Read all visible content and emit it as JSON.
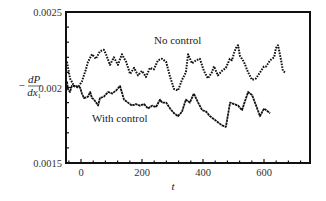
{
  "chart_data": {
    "type": "line",
    "title": "",
    "xlabel": "t",
    "ylabel": "-dP/dx1",
    "xlim": [
      -45,
      755
    ],
    "ylim": [
      0.0015,
      0.0025
    ],
    "x_ticks": [
      0,
      200,
      400,
      600
    ],
    "x_tick_labels": [
      "0",
      "200",
      "400",
      "600"
    ],
    "y_ticks": [
      0.0015,
      0.002,
      0.0025
    ],
    "y_tick_labels": [
      "0.0015",
      "0.002",
      "0.0025"
    ],
    "grid": false,
    "legend": "inline annotations",
    "annotations": [
      {
        "text": "No control",
        "x": 260,
        "y": 0.00233
      },
      {
        "text": "With control",
        "x": 155,
        "y": 0.00192
      }
    ],
    "series": [
      {
        "name": "No control",
        "style": "dashed",
        "x": [
          -49,
          -36,
          -23,
          -10,
          3,
          16,
          23,
          36,
          49,
          62,
          75,
          82,
          95,
          108,
          121,
          134,
          148,
          161,
          174,
          187,
          200,
          213,
          226,
          239,
          252,
          266,
          279,
          292,
          305,
          318,
          331,
          344,
          351,
          364,
          377,
          390,
          403,
          416,
          429,
          436,
          449,
          462,
          475,
          488,
          495,
          502,
          508,
          515,
          521,
          534,
          548,
          561,
          574,
          587,
          600,
          607,
          620,
          633,
          639,
          646,
          656,
          662,
          669
        ],
        "y": [
          0.00217,
          0.00206,
          0.00201,
          0.002,
          0.00204,
          0.00212,
          0.00217,
          0.00222,
          0.00219,
          0.00224,
          0.00225,
          0.00222,
          0.00215,
          0.0022,
          0.00215,
          0.00222,
          0.00217,
          0.00209,
          0.00213,
          0.00208,
          0.00211,
          0.00207,
          0.00213,
          0.00212,
          0.00218,
          0.00219,
          0.00217,
          0.00207,
          0.00199,
          0.00198,
          0.00205,
          0.0021,
          0.00222,
          0.00216,
          0.00218,
          0.00219,
          0.00211,
          0.00206,
          0.0021,
          0.00214,
          0.00208,
          0.00211,
          0.00213,
          0.00219,
          0.00218,
          0.00223,
          0.00226,
          0.00228,
          0.00221,
          0.00217,
          0.0021,
          0.00205,
          0.00206,
          0.0021,
          0.00214,
          0.00214,
          0.00218,
          0.0022,
          0.00226,
          0.00228,
          0.00218,
          0.00211,
          0.0021
        ]
      },
      {
        "name": "With control",
        "style": "dotted-solid",
        "x": [
          -49,
          -43,
          -36,
          -30,
          -16,
          -3,
          3,
          10,
          23,
          30,
          36,
          43,
          56,
          62,
          75,
          89,
          102,
          115,
          128,
          141,
          154,
          167,
          180,
          193,
          207,
          220,
          233,
          246,
          259,
          266,
          279,
          292,
          305,
          318,
          331,
          344,
          357,
          370,
          384,
          397,
          410,
          423,
          436,
          449,
          462,
          475,
          489,
          502,
          515,
          528,
          541,
          548,
          561,
          574,
          587,
          600,
          607,
          620
        ],
        "y": [
          0.00204,
          0.00199,
          0.00197,
          0.00201,
          0.00201,
          0.002,
          0.00196,
          0.00193,
          0.00194,
          0.00197,
          0.00193,
          0.00192,
          0.00188,
          0.00193,
          0.00194,
          0.00197,
          0.00196,
          0.00198,
          0.00201,
          0.00192,
          0.0019,
          0.00188,
          0.00189,
          0.00188,
          0.00189,
          0.00186,
          0.00188,
          0.00187,
          0.00192,
          0.0019,
          0.0019,
          0.00186,
          0.00183,
          0.00181,
          0.00184,
          0.00192,
          0.0019,
          0.00196,
          0.0019,
          0.00185,
          0.00184,
          0.00181,
          0.00179,
          0.00177,
          0.00175,
          0.00174,
          0.0019,
          0.00189,
          0.00188,
          0.00185,
          0.00193,
          0.00197,
          0.00195,
          0.00188,
          0.00181,
          0.00186,
          0.00185,
          0.00183
        ]
      }
    ]
  }
}
